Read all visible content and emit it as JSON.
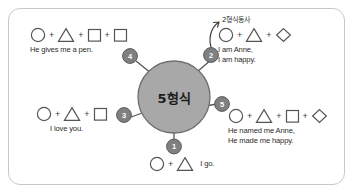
{
  "diagram": {
    "title_center": "5형식",
    "frame_color": "#c8c8c8",
    "circle_fill": "#a8a8a8",
    "circle_stroke": "#6e6e6e",
    "badge_dark_fill": "#808080",
    "badge_light_fill": "#d0d0d0",
    "shape_stroke": "#555555",
    "annotation": {
      "label": "2형식동사",
      "points_to": "branch-2"
    },
    "branches": [
      {
        "id": "branch-1",
        "number": "1",
        "badge_style": "dark",
        "shapes": [
          "circle",
          "triangle"
        ],
        "sentence": "I go.",
        "sentence_layout": "inline",
        "position": "bottom"
      },
      {
        "id": "branch-2",
        "number": "2",
        "badge_style": "dark",
        "shapes": [
          "circle",
          "triangle",
          "diamond"
        ],
        "sentence": "I am Anne,\nI am happy.",
        "sentence_layout": "below",
        "position": "top-right"
      },
      {
        "id": "branch-3",
        "number": "3",
        "badge_style": "dark",
        "shapes": [
          "circle",
          "triangle",
          "square"
        ],
        "sentence": "I love you.",
        "sentence_layout": "below",
        "position": "left"
      },
      {
        "id": "branch-4",
        "number": "4",
        "badge_style": "dark",
        "shapes": [
          "circle",
          "triangle",
          "square",
          "square"
        ],
        "sentence": "He gives me a pen.",
        "sentence_layout": "below",
        "position": "top-left"
      },
      {
        "id": "branch-5",
        "number": "5",
        "badge_style": "dark",
        "shapes": [
          "circle",
          "triangle",
          "square",
          "diamond"
        ],
        "sentence": "He named me Anne,\nHe made me happy.",
        "sentence_layout": "below",
        "position": "right"
      }
    ]
  }
}
